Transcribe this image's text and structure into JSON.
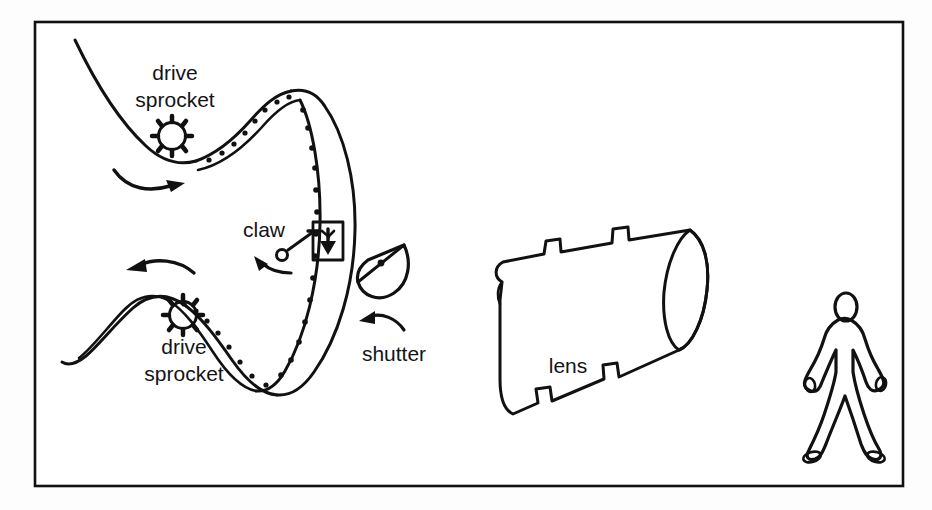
{
  "document": {
    "kind": "technical-line-diagram",
    "subject": "motion picture camera film transport mechanism",
    "background_color": "#fdfdfd",
    "ink_color": "#111111",
    "frame": {
      "name": "outer-border",
      "x": 35,
      "y": 22,
      "width": 868,
      "height": 464,
      "stroke_width": 2.6
    }
  },
  "labels": [
    {
      "id": "drive-sprocket-top",
      "lines": [
        "drive",
        "sprocket"
      ],
      "line1": "drive",
      "line2": "sprocket",
      "x": 175,
      "y": 74,
      "line_height": 27
    },
    {
      "id": "claw",
      "lines": [
        "claw"
      ],
      "line1": "claw",
      "x": 264,
      "y": 231
    },
    {
      "id": "drive-sprocket-bottom",
      "lines": [
        "drive",
        "sprocket"
      ],
      "line1": "drive",
      "line2": "sprocket",
      "x": 184,
      "y": 348,
      "line_height": 27
    },
    {
      "id": "shutter",
      "lines": [
        "shutter"
      ],
      "line1": "shutter",
      "x": 394,
      "y": 355
    },
    {
      "id": "lens",
      "lines": [
        "lens"
      ],
      "line1": "lens",
      "x": 568,
      "y": 367
    }
  ],
  "components": [
    {
      "id": "film-strip",
      "name": "film-strip-loop",
      "description": "serpentine perforated film path forming a vertical loop",
      "perforation_count": 26
    },
    {
      "id": "sprocket-top",
      "name": "drive-sprocket-gear-top",
      "center_x": 172,
      "center_y": 136,
      "radius": 15,
      "teeth": 9
    },
    {
      "id": "sprocket-bottom",
      "name": "drive-sprocket-gear-bottom",
      "center_x": 183,
      "center_y": 315,
      "radius": 15,
      "teeth": 9
    },
    {
      "id": "rotation-arrow-top",
      "name": "rotation-arrow-clockwise",
      "direction": "right"
    },
    {
      "id": "rotation-arrow-bottom",
      "name": "rotation-arrow-counterclockwise",
      "direction": "left"
    },
    {
      "id": "claw-mechanism",
      "name": "claw-pin",
      "pivot_x": 280,
      "pivot_y": 255
    },
    {
      "id": "claw-motion-arrow",
      "name": "claw-motion-arrow",
      "direction": "left-up"
    },
    {
      "id": "film-frame-window",
      "name": "film-frame-gate",
      "contains": "down-arrow-image",
      "x": 313,
      "y": 222,
      "width": 30,
      "height": 38
    },
    {
      "id": "shutter-disc",
      "name": "half-disc-shutter",
      "center_x": 379,
      "center_y": 266,
      "radius": 28
    },
    {
      "id": "shutter-rotation-arrow",
      "name": "shutter-rotation-arrow",
      "direction": "left"
    },
    {
      "id": "lens-barrel",
      "name": "stepped-lens-barrel",
      "description": "stepped cylindrical lens barrel in three-quarter view"
    },
    {
      "id": "subject-figure",
      "name": "human-subject-figure",
      "description": "outline of standing person being filmed",
      "x": 806,
      "y": 295,
      "height": 160
    }
  ]
}
